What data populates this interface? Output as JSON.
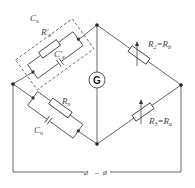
{
  "diagram": {
    "type": "AC bridge circuit (Schering/Wien-style)",
    "labels": {
      "cx": "C",
      "cx_sub": "x",
      "rx_prime": "R'",
      "rx_prime_sub": "x",
      "cx_prime": "C'",
      "cx_prime_sub": "x",
      "r2": "R",
      "r2_sub": "2",
      "r2_eq": "=R",
      "r2_eq_sub": "b",
      "r3": "R",
      "r3_sub": "3",
      "r3_eq": "=R",
      "r3_eq_sub": "a",
      "rn": "R",
      "rn_sub": "n",
      "cn": "C",
      "cn_sub": "n",
      "galvanometer": "G",
      "terminal_left": "ø",
      "terminal_dash": "–",
      "terminal_right": "ø"
    },
    "nodes": {
      "top": [
        97,
        25
      ],
      "left": [
        13,
        84
      ],
      "right": [
        181,
        85
      ],
      "bottom": [
        97,
        144
      ]
    },
    "colors": {
      "wire": "#555555",
      "node": "#222222",
      "text": "#444444",
      "background": "#ffffff"
    }
  }
}
